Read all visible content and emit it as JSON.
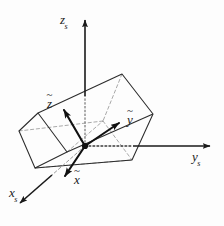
{
  "figure": {
    "background_color": "#fdfdfd",
    "stroke_color": "#1a1a1a",
    "box_edge_color": "#2b2b2b",
    "hidden_edge_color": "#9a9a9a",
    "origin": {
      "x": 85,
      "y": 146,
      "marker": "filled-dot"
    },
    "space_frame": {
      "name": "space-frame",
      "axes": [
        {
          "id": "zs",
          "label": "z",
          "subscript": "s",
          "direction": "up",
          "tip": {
            "x": 85,
            "y": 14
          },
          "tail": {
            "x": 85,
            "y": 146
          },
          "style": "solid-with-dotted-occluded-segment",
          "label_pos": {
            "x": 60,
            "y": 13
          }
        },
        {
          "id": "ys",
          "label": "y",
          "subscript": "s",
          "direction": "right",
          "tip": {
            "x": 216,
            "y": 146
          },
          "tail": {
            "x": 85,
            "y": 146
          },
          "style": "solid-with-dotted-occluded-segment",
          "label_pos": {
            "x": 192,
            "y": 150
          }
        },
        {
          "id": "xs",
          "label": "x",
          "subscript": "s",
          "direction": "down-left",
          "tip": {
            "x": 14,
            "y": 208
          },
          "tail": {
            "x": 85,
            "y": 146
          },
          "style": "solid-with-dotted-occluded-segment",
          "label_pos": {
            "x": 9,
            "y": 186
          }
        }
      ]
    },
    "body_frame": {
      "name": "body-frame",
      "accent_color": "#111111",
      "axes": [
        {
          "id": "z-tilde",
          "label": "z",
          "accent": "tilde",
          "direction": "up-left",
          "tip": {
            "x": 62,
            "y": 107
          },
          "tail": {
            "x": 85,
            "y": 146
          },
          "style": "solid-bold",
          "label_pos": {
            "x": 47,
            "y": 97
          }
        },
        {
          "id": "y-tilde",
          "label": "y",
          "accent": "tilde",
          "direction": "up-right",
          "tip": {
            "x": 122,
            "y": 120
          },
          "tail": {
            "x": 85,
            "y": 146
          },
          "style": "solid-bold",
          "label_pos": {
            "x": 127,
            "y": 113
          }
        },
        {
          "id": "x-tilde",
          "label": "x",
          "accent": "tilde",
          "direction": "down-left",
          "tip": {
            "x": 62,
            "y": 180
          },
          "tail": {
            "x": 85,
            "y": 146
          },
          "style": "solid-bold",
          "label_pos": {
            "x": 74,
            "y": 173
          }
        }
      ]
    },
    "box": {
      "name": "rectangular-parallelepiped",
      "description": "tilted rectangular box drawn in oblique projection with hidden edges dashed",
      "near_face": {
        "top": {
          "x": 38,
          "y": 113
        },
        "right": {
          "x": 67,
          "y": 152
        },
        "bottom": {
          "x": 35,
          "y": 168
        },
        "left": {
          "x": 19,
          "y": 131
        }
      },
      "far_face": {
        "top": {
          "x": 122,
          "y": 74
        },
        "right": {
          "x": 153,
          "y": 114
        },
        "bottom": {
          "x": 132,
          "y": 160
        },
        "left": {
          "x": 103,
          "y": 121
        }
      },
      "hidden_vertices": [
        "near-face-right",
        "far-face-left"
      ]
    },
    "tilde_glyph": "~"
  }
}
